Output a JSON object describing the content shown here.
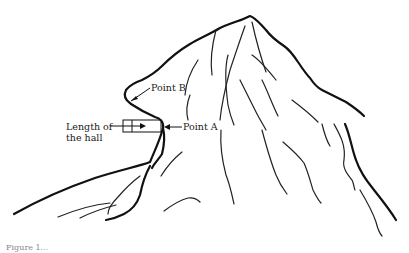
{
  "figure": {
    "labels": {
      "point_b": "Point B",
      "length_of_hall_line1": "Length of",
      "length_of_hall_line2": "the hall",
      "point_a": "Point A"
    },
    "caption": "Figure 1..."
  },
  "colors": {
    "ink": "#111111",
    "background": "#ffffff"
  }
}
